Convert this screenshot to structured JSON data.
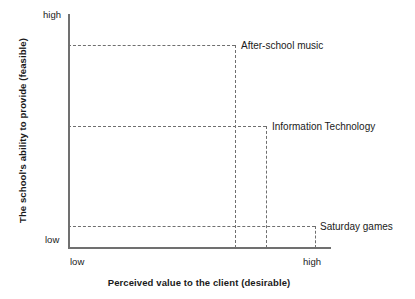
{
  "chart_data": {
    "type": "scatter",
    "title": "",
    "xlabel": "Perceived value to the client (desirable)",
    "ylabel": "The school's ability to provide (feasible)",
    "x_ticks": [
      "low",
      "high"
    ],
    "y_ticks": [
      "low",
      "high"
    ],
    "xlim": [
      "low",
      "high"
    ],
    "ylim": [
      "low",
      "high"
    ],
    "grid": false,
    "legend": "none",
    "guide_lines": "dashed",
    "points": [
      {
        "label": "After-school music",
        "x": "medium-high",
        "y": "high",
        "x_fraction": 0.64,
        "y_fraction": 0.87
      },
      {
        "label": "Information Technology",
        "x": "high",
        "y": "medium",
        "x_fraction": 0.75,
        "y_fraction": 0.52
      },
      {
        "label": "Saturday games",
        "x": "very-high",
        "y": "low",
        "x_fraction": 0.94,
        "y_fraction": 0.09
      }
    ],
    "colors": {
      "axis": "#707070",
      "guide": "#6f6f6f",
      "text": "#1a1a1a",
      "background": "#ffffff"
    }
  },
  "axes": {
    "y": {
      "title": "The school's ability to provide (feasible)",
      "high_label": "high",
      "low_label": "low"
    },
    "x": {
      "title": "Perceived value to the client (desirable)",
      "high_label": "high",
      "low_label": "low"
    }
  },
  "points": {
    "after_school_music": "After-school music",
    "information_technology": "Information Technology",
    "saturday_games": "Saturday games"
  }
}
